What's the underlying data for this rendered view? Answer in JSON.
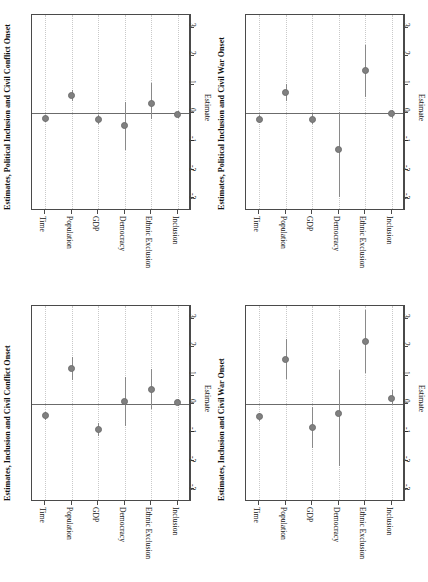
{
  "figure": {
    "layout": "2x2 grid of rotated coefficient (forest) plots",
    "background_color": "#ffffff",
    "point_color": "#808080",
    "whisker_color": "#8a8a8a",
    "gridline_color": "#c9c9c9",
    "axis_color": "#4a4a4a",
    "zeroline_color": "#6b6b6b"
  },
  "shared": {
    "categories": [
      "Time",
      "Population",
      "GDP",
      "Democracy",
      "Ethnic Exclusion",
      "Inclusion"
    ],
    "axis_title": "Estimate",
    "ticks": [
      "-3",
      "-2",
      "-1",
      "0",
      "1",
      "2",
      "3"
    ],
    "tick_values": [
      -3,
      -2,
      -1,
      0,
      1,
      2,
      3
    ],
    "xlim": [
      -3.45,
      3.45
    ],
    "zero_reference": 0,
    "grid": "dotted vertical gridline at each category position"
  },
  "chart_data": [
    {
      "id": "top-left",
      "type": "scatter",
      "title": "Estimates, Political Inclusion and Civil Conflict Onset",
      "xlabel": "",
      "ylabel": "Estimate",
      "orientation": "rotated-90",
      "categories": [
        "Time",
        "Population",
        "GDP",
        "Democracy",
        "Ethnic Exclusion",
        "Inclusion"
      ],
      "values": [
        -0.18,
        0.62,
        -0.23,
        -0.45,
        0.33,
        -0.04
      ],
      "ci_low": [
        -0.3,
        0.42,
        -0.38,
        -1.32,
        -0.22,
        -0.16
      ],
      "ci_high": [
        -0.06,
        0.8,
        -0.08,
        0.4,
        1.05,
        0.07
      ],
      "ylim": [
        -3.45,
        3.45
      ]
    },
    {
      "id": "top-right",
      "type": "scatter",
      "title": "Estimates, Political Inclusion and Civil War Onset",
      "xlabel": "",
      "ylabel": "Estimate",
      "orientation": "rotated-90",
      "categories": [
        "Time",
        "Population",
        "GDP",
        "Democracy",
        "Ethnic Exclusion",
        "Inclusion"
      ],
      "values": [
        -0.22,
        0.72,
        -0.22,
        -1.3,
        1.48,
        -0.03
      ],
      "ci_low": [
        -0.35,
        0.42,
        -0.4,
        -2.95,
        0.55,
        -0.18
      ],
      "ci_high": [
        -0.08,
        1.02,
        -0.04,
        0.02,
        2.38,
        0.1
      ],
      "ylim": [
        -3.45,
        3.45
      ]
    },
    {
      "id": "bottom-left",
      "type": "scatter",
      "title": "Estimates, Inclusion and Civil Conflict Onset",
      "xlabel": "",
      "ylabel": "Estimate",
      "orientation": "rotated-90",
      "categories": [
        "Time",
        "Population",
        "GDP",
        "Democracy",
        "Ethnic Exclusion",
        "Inclusion"
      ],
      "values": [
        -0.42,
        1.25,
        -0.9,
        0.08,
        0.52,
        0.05
      ],
      "ci_low": [
        -0.55,
        0.85,
        -1.12,
        -0.78,
        -0.18,
        -0.08
      ],
      "ci_high": [
        -0.28,
        1.65,
        -0.66,
        0.95,
        1.22,
        0.18
      ],
      "ylim": [
        -3.45,
        3.45
      ]
    },
    {
      "id": "bottom-right",
      "type": "scatter",
      "title": "Estimates, Inclusion and Civil War Onset",
      "xlabel": "",
      "ylabel": "Estimate",
      "orientation": "rotated-90",
      "categories": [
        "Time",
        "Population",
        "GDP",
        "Democracy",
        "Ethnic Exclusion",
        "Inclusion"
      ],
      "values": [
        -0.45,
        1.58,
        -0.82,
        -0.35,
        2.2,
        0.2
      ],
      "ci_low": [
        -0.6,
        0.88,
        -1.55,
        -2.2,
        1.1,
        -0.05
      ],
      "ci_high": [
        -0.3,
        2.28,
        -0.12,
        1.18,
        3.32,
        0.48
      ],
      "ylim": [
        -3.45,
        3.45
      ]
    }
  ]
}
